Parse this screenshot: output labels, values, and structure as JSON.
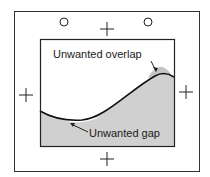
{
  "diagram": {
    "labels": {
      "overlap": "Unwanted overlap",
      "gap": "Unwanted gap"
    },
    "registration_marks": {
      "circles": 2,
      "crosses": 4
    },
    "colors": {
      "stroke": "#1a1a1a",
      "fill": "#d0d0d0",
      "background": "#ffffff"
    }
  }
}
